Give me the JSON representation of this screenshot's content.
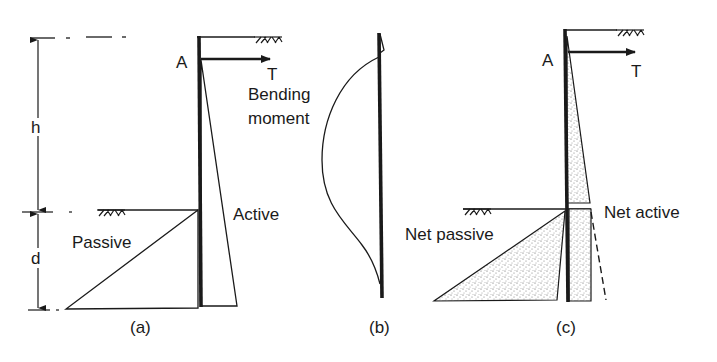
{
  "figure": {
    "colors": {
      "ink": "#1a1a1a",
      "background": "#ffffff",
      "stipple": "#555555"
    }
  },
  "panel_a": {
    "caption": "(a)",
    "anchor_label": "A",
    "tie_label": "T",
    "height_label": "h",
    "depth_label": "d",
    "active_label": "Active",
    "passive_label": "Passive"
  },
  "panel_b": {
    "caption": "(b)",
    "bending_label_line1": "Bending",
    "bending_label_line2": "moment"
  },
  "panel_c": {
    "caption": "(c)",
    "anchor_label": "A",
    "tie_label": "T",
    "net_active_label": "Net active",
    "net_passive_label": "Net passive"
  }
}
